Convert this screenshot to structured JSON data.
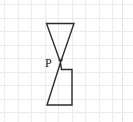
{
  "figure": {
    "background_color": "#ffffff",
    "stroke_color": "#2b2b33",
    "grid": {
      "visible": true,
      "color": "#ececf0",
      "spacing_px": 13.5,
      "x_lines": [
        4,
        17.5,
        31,
        44.5,
        58,
        71.5,
        85,
        98.5,
        112,
        121.5
      ],
      "y_lines": [
        4,
        17.5,
        31,
        44.5,
        58,
        71.5,
        85,
        98.5,
        112
      ]
    },
    "labels": [
      {
        "name": "point-label-p",
        "text": "P",
        "x": 45,
        "y": 67
      }
    ],
    "vertex_marker": {
      "name": "vertex-tick-p",
      "x": 60.5,
      "y": 62.5
    },
    "shapes": [
      {
        "name": "upper-triangle",
        "type": "polygon",
        "points": "46.5,23.5 74,23.5 60.5,62.5",
        "description": "downward-pointing triangle with apex at P"
      },
      {
        "name": "lower-notched-quadrilateral",
        "type": "polyline",
        "points": "60.5,62.5 61.5,69.5 72,69.5 72,105 47,105 60.5,62.5",
        "description": "quadrilateral with a stepped notch at the top-left meeting P"
      }
    ]
  }
}
